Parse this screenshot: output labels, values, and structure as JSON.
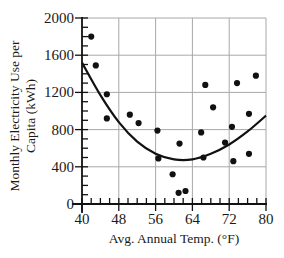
{
  "chart_data": {
    "type": "scatter",
    "title": "",
    "xlabel": "Avg. Annual Temp. (°F)",
    "ylabel_lines": [
      "Monthly Electricity Use per",
      "Capita (kWh)"
    ],
    "ylabel": "Monthly Electricity Use per Capita (kWh)",
    "xlim": [
      40,
      80
    ],
    "ylim": [
      0,
      2000
    ],
    "xticks": [
      40,
      48,
      56,
      64,
      72,
      80
    ],
    "yticks": [
      0,
      400,
      800,
      1200,
      1600,
      2000
    ],
    "x_minor_step": 2,
    "y_minor_step": 100,
    "grid": true,
    "legend": null,
    "series": [
      {
        "name": "observations",
        "kind": "scatter",
        "points": [
          [
            42,
            1800
          ],
          [
            43,
            1490
          ],
          [
            45.4,
            1180
          ],
          [
            45.4,
            920
          ],
          [
            50.4,
            960
          ],
          [
            52.3,
            870
          ],
          [
            56.4,
            790
          ],
          [
            56.6,
            490
          ],
          [
            59.7,
            320
          ],
          [
            61,
            120
          ],
          [
            61.2,
            650
          ],
          [
            62.5,
            140
          ],
          [
            65.9,
            770
          ],
          [
            66.4,
            500
          ],
          [
            66.8,
            1280
          ],
          [
            68.5,
            1040
          ],
          [
            71.1,
            660
          ],
          [
            72.6,
            830
          ],
          [
            72.9,
            460
          ],
          [
            73.7,
            1300
          ],
          [
            76.3,
            540
          ],
          [
            76.3,
            970
          ],
          [
            77.8,
            1380
          ]
        ]
      },
      {
        "name": "quadratic fit",
        "kind": "curve",
        "points": [
          [
            40,
            1520
          ],
          [
            44,
            1170
          ],
          [
            48,
            880
          ],
          [
            52,
            670
          ],
          [
            56,
            540
          ],
          [
            60,
            480
          ],
          [
            64,
            480
          ],
          [
            68,
            540
          ],
          [
            72,
            640
          ],
          [
            76,
            780
          ],
          [
            80,
            950
          ]
        ]
      }
    ]
  }
}
